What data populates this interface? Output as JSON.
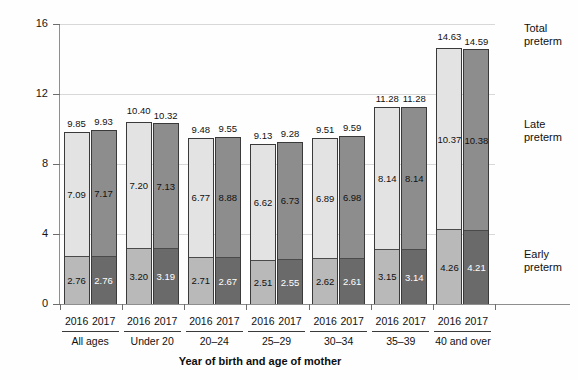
{
  "chart_data": {
    "type": "bar",
    "subtype": "stacked-grouped",
    "title": "",
    "xlabel": "Year of birth and age of mother",
    "ylabel": "Percent",
    "ylim": [
      0,
      16
    ],
    "yticks": [
      "0",
      "4",
      "8",
      "12",
      "16"
    ],
    "grid": true,
    "legend_position": "right",
    "categories": [
      "All ages",
      "Under 20",
      "20–24",
      "25–29",
      "30–34",
      "35–39",
      "40 and over"
    ],
    "year_labels": [
      "2016",
      "2017"
    ],
    "legend": [
      "Total preterm",
      "Late preterm",
      "Early preterm"
    ],
    "series": [
      {
        "name": "Early preterm",
        "year_2016": [
          2.76,
          3.2,
          2.71,
          2.51,
          2.62,
          3.15,
          4.26
        ],
        "year_2017": [
          2.76,
          3.19,
          2.67,
          2.55,
          2.61,
          3.14,
          4.21
        ]
      },
      {
        "name": "Late preterm",
        "year_2016": [
          7.09,
          7.2,
          6.77,
          6.62,
          6.89,
          8.14,
          10.37
        ],
        "year_2017": [
          7.17,
          7.13,
          8.88,
          6.73,
          6.98,
          8.14,
          10.38
        ]
      },
      {
        "name": "Total preterm",
        "year_2016": [
          9.85,
          10.4,
          9.48,
          9.13,
          9.51,
          11.28,
          14.63
        ],
        "year_2017": [
          9.93,
          10.32,
          9.55,
          9.28,
          9.59,
          11.28,
          14.59
        ]
      }
    ],
    "labels": {
      "early_2016": [
        "2.76",
        "3.20",
        "2.71",
        "2.51",
        "2.62",
        "3.15",
        "4.26"
      ],
      "early_2017": [
        "2.76",
        "3.19",
        "2.67",
        "2.55",
        "2.61",
        "3.14",
        "4.21"
      ],
      "late_2016": [
        "7.09",
        "7.20",
        "6.77",
        "6.62",
        "6.89",
        "8.14",
        "10.37"
      ],
      "late_2017": [
        "7.17",
        "7.13",
        "8.88",
        "6.73",
        "6.98",
        "8.14",
        "10.38"
      ],
      "total_2016": [
        "9.85",
        "10.40",
        "9.48",
        "9.13",
        "9.51",
        "11.28",
        "14.63"
      ],
      "total_2017": [
        "9.93",
        "10.32",
        "9.55",
        "9.28",
        "9.59",
        "11.28",
        "14.59"
      ]
    },
    "colors": {
      "late_2016": "#e3e3e3",
      "early_2016": "#b9b9b9",
      "late_2017": "#8d8d8d",
      "early_2017": "#6a6a6a",
      "gridline": "#d8d8d8",
      "axis": "#8e8e8e",
      "bar_outline": "#3a3a3a"
    }
  }
}
